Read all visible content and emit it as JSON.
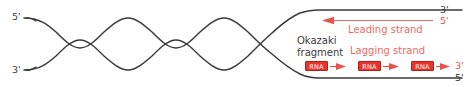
{
  "figure": {
    "colors": {
      "dna_strand": "#3b3b3b",
      "red_accent": "#e8524a",
      "rna_box_fill": "#e8342b",
      "rna_box_border": "#b0211a",
      "background": "#ffffff"
    }
  },
  "left_ends": {
    "top_prime": "5'",
    "bottom_prime": "3'"
  },
  "right_ends": {
    "top_outer_prime": "3'",
    "top_inner_prime": "5'",
    "bottom_inner_prime": "3'",
    "bottom_outer_prime": "5'"
  },
  "annotations": {
    "okazaki_line1": "Okazaki",
    "okazaki_line2": "fragment",
    "leading_strand": "Leading strand",
    "lagging_strand": "Lagging strand"
  },
  "rna_primers": [
    {
      "label": "RNA"
    },
    {
      "label": "RNA"
    },
    {
      "label": "RNA"
    }
  ]
}
